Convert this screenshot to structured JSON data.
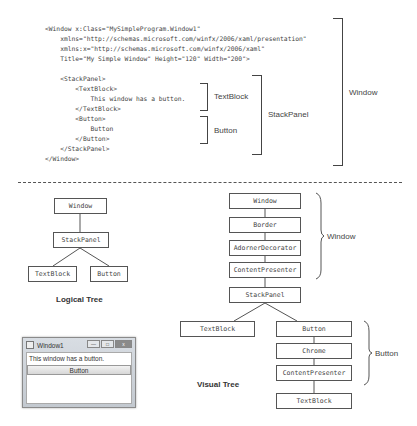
{
  "xaml_code": {
    "lines": [
      "<Window x:Class=\"MySimpleProgram.Window1\"",
      "    xmlns=\"http://schemas.microsoft.com/winfx/2006/xaml/presentation\"",
      "    xmlns:x=\"http://schemas.microsoft.com/winfx/2006/xaml\"",
      "    Title=\"My Simple Window\" Height=\"120\" Width=\"200\">",
      "",
      "    <StackPanel>",
      "        <TextBlock>",
      "            This window has a button.",
      "        </TextBlock>",
      "        <Button>",
      "            Button",
      "        </Button>",
      "    </StackPanel>",
      "</Window>"
    ]
  },
  "code_brackets": {
    "textblock": "TextBlock",
    "button": "Button",
    "stackpanel": "StackPanel",
    "window": "Window"
  },
  "logical_tree": {
    "title": "Logical Tree",
    "nodes": {
      "window": "Window",
      "stackpanel": "StackPanel",
      "textblock": "TextBlock",
      "button": "Button"
    }
  },
  "visual_tree": {
    "title": "Visual Tree",
    "nodes": {
      "window": "Window",
      "border": "Border",
      "adorner_decorator": "AdornerDecorator",
      "content_presenter_window": "ContentPresenter",
      "stackpanel": "StackPanel",
      "textblock_left": "TextBlock",
      "button": "Button",
      "chrome": "Chrome",
      "content_presenter_button": "ContentPresenter",
      "textblock_button": "TextBlock"
    },
    "group_labels": {
      "window": "Window",
      "button": "Button"
    }
  },
  "rendered_window": {
    "title": "Window1",
    "text": "This window has a button.",
    "button_label": "Button",
    "controls": {
      "minimize": "—",
      "maximize": "□",
      "close": "x"
    }
  }
}
